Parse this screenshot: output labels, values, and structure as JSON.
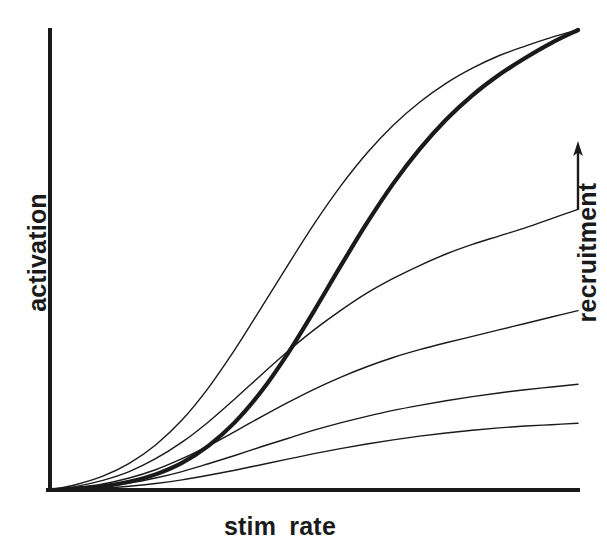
{
  "figure": {
    "background_color": "#ffffff",
    "ink_color": "#1a1a1a",
    "axis_color": "#1a1a1a"
  },
  "labels": {
    "y_axis": "activation",
    "x_axis": "stim  rate",
    "right_axis": "recruitment",
    "right_axis_arrow": "arrow-up-icon"
  },
  "chart_data": {
    "type": "line",
    "title": "",
    "xlabel": "stim  rate",
    "ylabel": "activation",
    "secondary_axis_label": "recruitment",
    "secondary_axis_direction": "increasing-upward",
    "grid": false,
    "legend": "none",
    "axis_ticks": "none",
    "xlim": [
      0,
      1
    ],
    "ylim": [
      0,
      1
    ],
    "x": [
      0.0,
      0.05,
      0.1,
      0.15,
      0.2,
      0.25,
      0.3,
      0.35,
      0.4,
      0.45,
      0.5,
      0.55,
      0.6,
      0.65,
      0.7,
      0.75,
      0.8,
      0.85,
      0.9,
      0.95,
      1.0
    ],
    "series": [
      {
        "name": "curve-1-steepest",
        "emphasis": "thin",
        "linewidth_px": 1.4,
        "plateau": 1.0,
        "values": [
          0.0,
          0.012,
          0.03,
          0.058,
          0.098,
          0.152,
          0.222,
          0.305,
          0.396,
          0.488,
          0.578,
          0.66,
          0.732,
          0.793,
          0.843,
          0.884,
          0.917,
          0.944,
          0.965,
          0.984,
          1.0
        ]
      },
      {
        "name": "curve-2-aggregate-bold",
        "emphasis": "bold",
        "linewidth_px": 4.2,
        "plateau": 1.0,
        "values": [
          0.0,
          0.003,
          0.008,
          0.018,
          0.034,
          0.059,
          0.096,
          0.147,
          0.214,
          0.296,
          0.389,
          0.486,
          0.58,
          0.666,
          0.741,
          0.805,
          0.858,
          0.902,
          0.939,
          0.972,
          1.0
        ]
      },
      {
        "name": "curve-3",
        "emphasis": "thin",
        "linewidth_px": 1.4,
        "plateau": 0.61,
        "values": [
          0.0,
          0.008,
          0.021,
          0.04,
          0.068,
          0.104,
          0.148,
          0.198,
          0.25,
          0.301,
          0.348,
          0.39,
          0.428,
          0.46,
          0.488,
          0.513,
          0.534,
          0.552,
          0.57,
          0.59,
          0.61
        ]
      },
      {
        "name": "curve-4",
        "emphasis": "thin",
        "linewidth_px": 1.4,
        "plateau": 0.39,
        "values": [
          0.0,
          0.005,
          0.013,
          0.026,
          0.044,
          0.068,
          0.096,
          0.127,
          0.159,
          0.19,
          0.219,
          0.245,
          0.268,
          0.288,
          0.305,
          0.32,
          0.334,
          0.348,
          0.362,
          0.376,
          0.39
        ]
      },
      {
        "name": "curve-5",
        "emphasis": "thin",
        "linewidth_px": 1.4,
        "plateau": 0.23,
        "values": [
          0.0,
          0.003,
          0.008,
          0.015,
          0.026,
          0.04,
          0.057,
          0.075,
          0.094,
          0.112,
          0.13,
          0.146,
          0.16,
          0.173,
          0.184,
          0.194,
          0.203,
          0.211,
          0.218,
          0.224,
          0.23
        ]
      },
      {
        "name": "curve-6-shallowest",
        "emphasis": "thin",
        "linewidth_px": 1.4,
        "plateau": 0.145,
        "values": [
          0.0,
          0.0015,
          0.004,
          0.008,
          0.014,
          0.022,
          0.032,
          0.043,
          0.055,
          0.067,
          0.079,
          0.09,
          0.1,
          0.109,
          0.117,
          0.124,
          0.13,
          0.135,
          0.139,
          0.142,
          0.145
        ]
      }
    ]
  },
  "geometry": {
    "origin_x": 50,
    "origin_y": 490,
    "plot_right": 578,
    "plot_top": 30,
    "axis_thickness_px": 4
  }
}
